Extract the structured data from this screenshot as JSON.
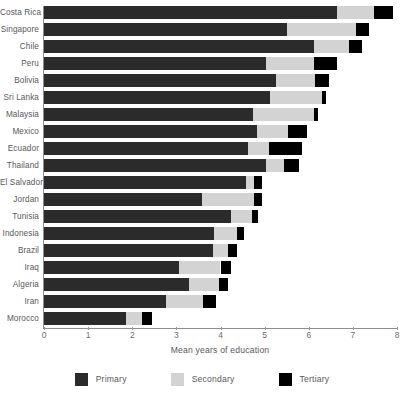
{
  "chart_data": {
    "type": "bar",
    "orientation": "horizontal",
    "stacked": true,
    "title": "",
    "xlabel": "Mean years of education",
    "ylabel": "",
    "xlim": [
      0,
      8
    ],
    "xticks": [
      0,
      1,
      2,
      3,
      4,
      5,
      6,
      7,
      8
    ],
    "xtick_labels": [
      "0",
      "1",
      "2",
      "3",
      "4",
      "5",
      "6",
      "7",
      "8"
    ],
    "grid": false,
    "legend_position": "bottom",
    "categories": [
      "Costa Rica",
      "Singapore",
      "Chile",
      "Peru",
      "Bolivia",
      "Sri Lanka",
      "Malaysia",
      "Mexico",
      "Ecuador",
      "Thailand",
      "El Salvador",
      "Jordan",
      "Tunisia",
      "Indonesia",
      "Brazil",
      "Iraq",
      "Algeria",
      "Iran",
      "Morocco"
    ],
    "series": [
      {
        "name": "Primary",
        "color": "#2b2b2b",
        "values": [
          6.65,
          5.5,
          6.13,
          5.04,
          5.25,
          5.13,
          4.73,
          4.82,
          4.62,
          5.04,
          4.57,
          3.58,
          4.23,
          3.85,
          3.82,
          3.05,
          3.28,
          2.76,
          1.86
        ]
      },
      {
        "name": "Secondary",
        "color": "#d3d3d3",
        "values": [
          0.84,
          1.56,
          0.79,
          1.09,
          0.9,
          1.18,
          1.38,
          0.7,
          0.49,
          0.41,
          0.2,
          1.17,
          0.48,
          0.52,
          0.34,
          0.95,
          0.68,
          0.84,
          0.36
        ]
      },
      {
        "name": "Tertiary",
        "color": "#000000",
        "values": [
          0.41,
          0.31,
          0.28,
          0.5,
          0.32,
          0.09,
          0.09,
          0.43,
          0.73,
          0.32,
          0.18,
          0.18,
          0.13,
          0.16,
          0.21,
          0.23,
          0.2,
          0.29,
          0.22
        ]
      }
    ],
    "totals": [
      7.9,
      7.37,
      7.2,
      6.63,
      6.47,
      6.4,
      6.2,
      5.95,
      5.84,
      5.77,
      4.95,
      4.93,
      4.84,
      4.53,
      4.37,
      4.23,
      4.16,
      3.89,
      2.44
    ]
  },
  "legend": {
    "items": [
      {
        "label": "Primary",
        "color": "#2b2b2b"
      },
      {
        "label": "Secondary",
        "color": "#d3d3d3"
      },
      {
        "label": "Tertiary",
        "color": "#000000"
      }
    ]
  }
}
